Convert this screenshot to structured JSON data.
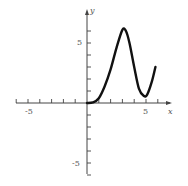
{
  "chart_data": {
    "type": "line",
    "title": "",
    "xlabel": "x",
    "ylabel": "y",
    "xlim": [
      -6,
      7
    ],
    "ylim": [
      -6,
      8
    ],
    "grid": false,
    "x_tick_labels": [
      {
        "value": -5,
        "label": "-5"
      },
      {
        "value": 5,
        "label": "5"
      }
    ],
    "y_tick_labels": [
      {
        "value": 5,
        "label": "5"
      },
      {
        "value": -5,
        "label": "-5"
      }
    ],
    "x_ticks": [
      -6,
      -5,
      -4,
      -3,
      -2,
      -1,
      1,
      2,
      3,
      4,
      5,
      6
    ],
    "y_ticks": [
      -6,
      -5,
      -4,
      -3,
      -2,
      -1,
      1,
      2,
      3,
      4,
      5,
      6
    ],
    "series": [
      {
        "name": "f(x)",
        "x": [
          0,
          0.5,
          1,
          1.5,
          2,
          2.5,
          3,
          3.3,
          3.6,
          4,
          4.4,
          4.8,
          5.1,
          5.5,
          5.8
        ],
        "y": [
          0,
          0.05,
          0.4,
          1.4,
          2.8,
          4.6,
          6.1,
          6.0,
          5.0,
          3.0,
          1.2,
          0.6,
          0.7,
          1.8,
          3.0
        ]
      }
    ]
  },
  "labels": {
    "x_axis": "x",
    "y_axis": "y",
    "x_neg5": "-5",
    "x_pos5": "5",
    "y_pos5": "5",
    "y_neg5": "-5"
  }
}
